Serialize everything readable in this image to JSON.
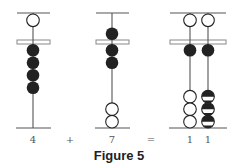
{
  "figure": {
    "caption": "Figure 5",
    "colors": {
      "ink": "#222222",
      "bar": "#555555",
      "beam": "#888888"
    }
  },
  "abaci": [
    {
      "name": "abacus-four",
      "label": "4",
      "rods": [
        {
          "upper": [
            "white"
          ],
          "lower": [
            "black",
            "black",
            "black",
            "black"
          ],
          "upper_set": false,
          "lower_set": 4
        }
      ]
    },
    {
      "name": "abacus-seven",
      "label": "7",
      "rods": [
        {
          "upper": [
            "black"
          ],
          "lower": [
            "black",
            "black",
            "white",
            "white"
          ],
          "upper_set": true,
          "lower_set": 2
        }
      ]
    },
    {
      "name": "abacus-eleven",
      "label": "1 1",
      "digits": [
        "1",
        "1"
      ],
      "rods": [
        {
          "upper": [
            "white"
          ],
          "lower": [
            "black",
            "white",
            "white",
            "white"
          ],
          "upper_set": false,
          "lower_set": 1
        },
        {
          "upper": [
            "white"
          ],
          "lower": [
            "black",
            "half",
            "half",
            "half"
          ],
          "upper_set": false,
          "lower_set": 1
        }
      ]
    }
  ],
  "operators": {
    "plus": "+",
    "equals": "="
  }
}
